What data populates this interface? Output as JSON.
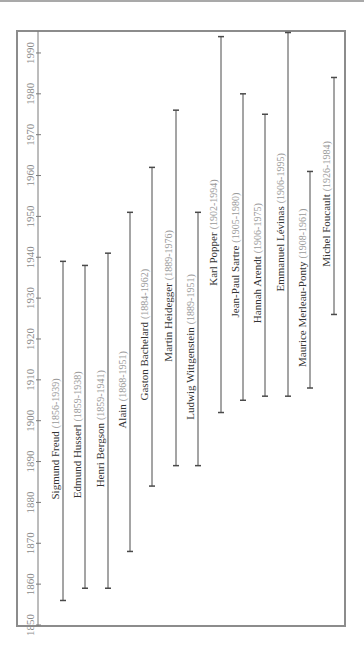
{
  "chart_data": {
    "type": "timeline",
    "orientation": "rotated-90-ccw",
    "title": "",
    "axis": {
      "label": "",
      "ticks": [
        1850,
        1860,
        1870,
        1880,
        1890,
        1900,
        1910,
        1920,
        1930,
        1940,
        1950,
        1960,
        1970,
        1980,
        1990
      ],
      "range": [
        1850,
        1993
      ]
    },
    "grid": false,
    "legend": null,
    "series": [
      {
        "name": "Sigmund Freud",
        "dates": "(1856-1939)",
        "start": 1856,
        "end": 1939
      },
      {
        "name": "Edmund Husserl",
        "dates": "(1859-1938)",
        "start": 1859,
        "end": 1938
      },
      {
        "name": "Henri Bergson",
        "dates": "(1859-1941)",
        "start": 1859,
        "end": 1941
      },
      {
        "name": "Alain",
        "dates": "(1868-1951)",
        "start": 1868,
        "end": 1951
      },
      {
        "name": "Gaston Bachelard",
        "dates": "(1884-1962)",
        "start": 1884,
        "end": 1962
      },
      {
        "name": "Martin Heidegger",
        "dates": "(1889-1976)",
        "start": 1889,
        "end": 1976
      },
      {
        "name": "Ludwig Wittgenstein",
        "dates": "(1889-1951)",
        "start": 1889,
        "end": 1951
      },
      {
        "name": "Karl Popper",
        "dates": "(1902-1994)",
        "start": 1902,
        "end": 1994
      },
      {
        "name": "Jean-Paul Sartre",
        "dates": "(1905-1980)",
        "start": 1905,
        "end": 1980
      },
      {
        "name": "Hannah Arendt",
        "dates": "(1906-1975)",
        "start": 1906,
        "end": 1975
      },
      {
        "name": "Emmanuel Lévinas",
        "dates": "(1906-1995)",
        "start": 1906,
        "end": 1995
      },
      {
        "name": "Maurice Merleau-Ponty",
        "dates": "(1908-1961)",
        "start": 1908,
        "end": 1961
      },
      {
        "name": "Michel Foucault",
        "dates": "(1926-1984)",
        "start": 1926,
        "end": 1984
      }
    ]
  },
  "colors": {
    "frame": "#8c8c8c",
    "axis": "#7a7a7a",
    "bar": "#4a4a4a",
    "name_text": "#333333",
    "date_text": "#9a9a9a",
    "tick_text": "#8a8a8a",
    "top_strip": "#a9a9a9"
  },
  "layout": {
    "frame": {
      "x": 17,
      "y": 31,
      "w": 328,
      "h": 595
    },
    "axis_x": 38,
    "year0": 1850,
    "y_at_year0": 625,
    "px_per_year": 4.086,
    "bar_x": [
      63,
      85,
      108,
      130,
      152,
      176,
      198,
      221,
      243,
      265,
      288,
      310,
      334
    ]
  }
}
